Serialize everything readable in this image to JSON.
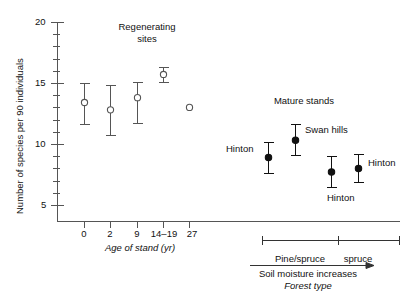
{
  "chart_data": {
    "type": "scatter",
    "title": "",
    "xlabel": "Age of stand (yr)",
    "ylabel": "Number of species per 90 individuals",
    "ylim": [
      4,
      20.8
    ],
    "yticks_major": [
      5,
      10,
      15,
      20
    ],
    "yticks_minor": [
      6,
      7,
      8,
      9,
      11,
      12,
      13,
      14,
      16,
      17,
      18,
      19
    ],
    "grid": false,
    "legend": "none",
    "group_labels": {
      "regenerating": "Regenerating\nsites",
      "regenerating_line1": "Regenerating",
      "regenerating_line2": "sites",
      "mature": "Mature stands"
    },
    "x_categories": [
      "0",
      "2",
      "9",
      "14–19",
      "27"
    ],
    "secondary_axis": {
      "bracket_labels": [
        "Pine/spruce",
        "spruce"
      ],
      "arrow_label": "Soil moisture increases",
      "axis_title": "Forest type"
    },
    "series": [
      {
        "name": "Regenerating sites",
        "marker": "open-circle",
        "points": [
          {
            "label": "0",
            "x": 84,
            "y": 13.4,
            "lo": 11.6,
            "hi": 15.0,
            "has_error": true
          },
          {
            "label": "2",
            "x": 110,
            "y": 12.8,
            "lo": 10.7,
            "hi": 14.8,
            "has_error": true
          },
          {
            "label": "9",
            "x": 137,
            "y": 13.8,
            "lo": 11.7,
            "hi": 15.1,
            "has_error": true
          },
          {
            "label": "14–19",
            "x": 163,
            "y": 15.7,
            "lo": 15.1,
            "hi": 16.3,
            "has_error": true
          },
          {
            "label": "27",
            "x": 189,
            "y": 13.0,
            "lo": 13.0,
            "hi": 13.0,
            "has_error": false
          }
        ]
      },
      {
        "name": "Mature stands",
        "marker": "filled-circle",
        "points": [
          {
            "label": "Hinton",
            "x": 268,
            "y": 8.9,
            "lo": 7.6,
            "hi": 10.2,
            "has_error": true,
            "label_pos": "left"
          },
          {
            "label": "Swan hills",
            "x": 295,
            "y": 10.3,
            "lo": 9.1,
            "hi": 11.6,
            "has_error": true,
            "label_pos": "right"
          },
          {
            "label": "Hinton",
            "x": 331,
            "y": 7.7,
            "lo": 6.5,
            "hi": 9.0,
            "has_error": true,
            "label_pos": "below"
          },
          {
            "label": "Hinton",
            "x": 358,
            "y": 8.0,
            "lo": 6.9,
            "hi": 9.2,
            "has_error": true,
            "label_pos": "right"
          }
        ]
      }
    ]
  },
  "annotations": {
    "regenerating_l1": "Regenerating",
    "regenerating_l2": "sites",
    "mature_stands": "Mature stands",
    "hinton_1": "Hinton",
    "swan_hills": "Swan hills",
    "hinton_2": "Hinton",
    "hinton_3": "Hinton"
  },
  "axes": {
    "y_title": "Number of species per 90 individuals",
    "y_tick_20": "20",
    "y_tick_15": "15",
    "y_tick_10": "10",
    "y_tick_5": "5",
    "x_title": "Age of stand (yr)",
    "x_tick_0": "0",
    "x_tick_2": "2",
    "x_tick_9": "9",
    "x_tick_14_19": "14–19",
    "x_tick_27": "27"
  },
  "bottom": {
    "pine_spruce": "Pine/spruce",
    "spruce": "spruce",
    "soil_moisture": "Soil moisture increases",
    "forest_type": "Forest type"
  },
  "colors": {
    "axis": "#555555",
    "marker_open_stroke": "#555555",
    "marker_filled": "#111111",
    "text": "#111111",
    "background": "#ffffff"
  }
}
